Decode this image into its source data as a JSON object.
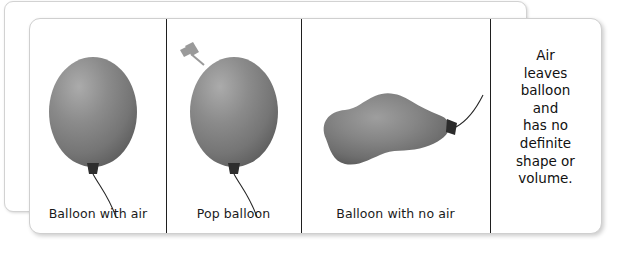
{
  "figure": {
    "kind": "science-diagram-card-stack",
    "background_color": "#ffffff",
    "card_color": "#ffffff",
    "divider_color": "#1f1f1f",
    "balloon_color": "#808080",
    "balloon_highlight_color": "#a8a8a8",
    "balloon_shadow_color": "#5e5e5e",
    "knot_color": "#2b2b2b",
    "string_color": "#222222",
    "pin_color": "#9a9a9a",
    "text_color": "#111111"
  },
  "panels": [
    {
      "id": "balloon-with-air",
      "caption": "Balloon with air",
      "art": "inflated-balloon"
    },
    {
      "id": "pop-balloon",
      "caption": "Pop balloon",
      "art": "inflated-balloon-with-pin",
      "icon": "pushpin-icon"
    },
    {
      "id": "balloon-with-no-air",
      "caption": "Balloon with no air",
      "art": "deflated-balloon"
    },
    {
      "id": "air-leaves-note",
      "caption": "",
      "art": "text-only",
      "note_lines": [
        "Air",
        "leaves",
        "balloon",
        "and",
        "has no",
        "definite",
        "shape or",
        "volume."
      ]
    }
  ]
}
